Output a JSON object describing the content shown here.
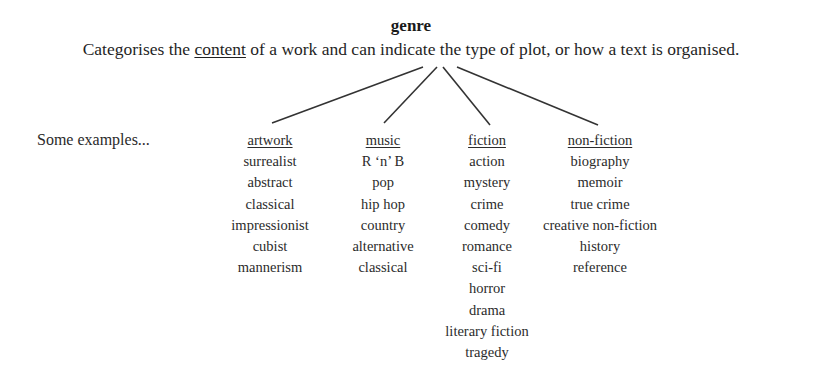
{
  "title": "genre",
  "definition": {
    "before": "Categorises the ",
    "underlined": "content",
    "after": " of a work and can indicate the type of plot, or how a text is organised."
  },
  "examples_label": "Some examples...",
  "connectors": [
    {
      "x1": 423,
      "y1": 67,
      "x2": 272,
      "y2": 123
    },
    {
      "x1": 437,
      "y1": 67,
      "x2": 384,
      "y2": 123
    },
    {
      "x1": 443,
      "y1": 67,
      "x2": 490,
      "y2": 125
    },
    {
      "x1": 457,
      "y1": 67,
      "x2": 598,
      "y2": 125
    }
  ],
  "categories": [
    {
      "heading": "artwork",
      "items": [
        "surrealist",
        "abstract",
        "classical",
        "impressionist",
        "cubist",
        "mannerism"
      ]
    },
    {
      "heading": "music",
      "items": [
        "R ‘n’ B",
        "pop",
        "hip hop",
        "country",
        "alternative",
        "classical"
      ]
    },
    {
      "heading": "fiction",
      "items": [
        "action",
        "mystery",
        "crime",
        "comedy",
        "romance",
        "sci-fi",
        "horror",
        "drama",
        "literary fiction",
        "tragedy"
      ]
    },
    {
      "heading": "non-fiction",
      "items": [
        "biography",
        "memoir",
        "true crime",
        "creative non-fiction",
        "history",
        "reference"
      ]
    }
  ]
}
